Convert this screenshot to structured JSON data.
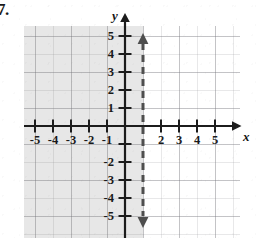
{
  "figure": {
    "problem_number": "7.",
    "type": "cartesian-coordinate-plane",
    "axis_labels": {
      "x": "x",
      "y": "y"
    },
    "grid": {
      "visible": true,
      "minor_spacing_units": 0.5,
      "major_spacing_units": 1
    },
    "x_axis": {
      "min": -6,
      "max": 6,
      "tick_labels": [
        "-5",
        "-4",
        "-3",
        "-2",
        "-1",
        "2",
        "3",
        "4",
        "5"
      ],
      "tick_values": [
        -5,
        -4,
        -3,
        -2,
        -1,
        2,
        3,
        4,
        5
      ],
      "arrow_ends": [
        "right"
      ]
    },
    "y_axis": {
      "min": -6,
      "max": 6,
      "tick_labels": [
        "5",
        "4",
        "3",
        "2",
        "1",
        "-2",
        "-3",
        "-4",
        "-5"
      ],
      "tick_values": [
        5,
        4,
        3,
        2,
        1,
        -2,
        -3,
        -4,
        -5
      ],
      "arrow_ends": [
        "up"
      ]
    },
    "boundary_line": {
      "style": "dashed",
      "orientation": "vertical",
      "equation": "x = 1",
      "x_intercept": 1,
      "arrow_ends": [
        "up",
        "down"
      ],
      "color": "#4a4a4a"
    },
    "shaded_region": {
      "side": "left",
      "inequality": "x < 1",
      "color": "#6e6e73"
    }
  }
}
